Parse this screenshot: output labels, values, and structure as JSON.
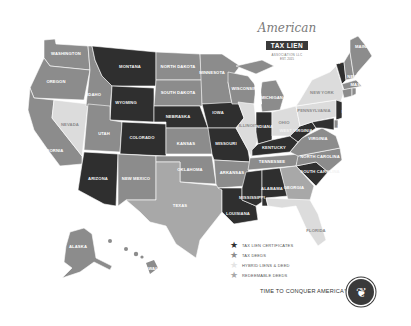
{
  "logo": {
    "script": "American",
    "ribbon": "TAX LIEN",
    "subtitle": "ASSOCIATION LLC",
    "est": "EST. 2015"
  },
  "colors": {
    "tax_lien_certificates": "#2f2f2f",
    "tax_deeds": "#8c8c8c",
    "hybrid_liens_deeds": "#dcdcdc",
    "redeemable_deeds": "#a8a8a8",
    "background": "#ffffff"
  },
  "legend": {
    "items": [
      {
        "label": "TAX LIEN CERTIFICATES",
        "color": "#2f2f2f",
        "icon": "star-icon"
      },
      {
        "label": "TAX DEEDS",
        "color": "#8c8c8c",
        "icon": "star-icon"
      },
      {
        "label": "HYBRID LIENS & DEED",
        "color": "#dcdcdc",
        "icon": "star-icon"
      },
      {
        "label": "REDEEMABLE DEEDS",
        "color": "#a8a8a8",
        "icon": "star-icon"
      }
    ]
  },
  "tagline": "TIME TO CONQUER AMERICA™",
  "seal_icon": "eagle-icon",
  "states": {
    "washington": {
      "label": "WASHINGTON",
      "category": "tax_deeds"
    },
    "oregon": {
      "label": "OREGON",
      "category": "tax_deeds"
    },
    "california": {
      "label": "CALIFORNIA",
      "category": "tax_deeds"
    },
    "nevada": {
      "label": "NEVADA",
      "category": "hybrid_liens_deeds"
    },
    "idaho": {
      "label": "IDAHO",
      "category": "tax_deeds"
    },
    "montana": {
      "label": "MONTANA",
      "category": "tax_lien_certificates"
    },
    "wyoming": {
      "label": "WYOMING",
      "category": "tax_lien_certificates"
    },
    "utah": {
      "label": "UTAH",
      "category": "tax_deeds"
    },
    "colorado": {
      "label": "COLORADO",
      "category": "tax_lien_certificates"
    },
    "arizona": {
      "label": "ARIZONA",
      "category": "tax_lien_certificates"
    },
    "new_mexico": {
      "label": "NEW MEXICO",
      "category": "tax_deeds"
    },
    "north_dakota": {
      "label": "NORTH DAKOTA",
      "category": "tax_deeds"
    },
    "south_dakota": {
      "label": "SOUTH DAKOTA",
      "category": "tax_deeds"
    },
    "nebraska": {
      "label": "NEBRASKA",
      "category": "tax_lien_certificates"
    },
    "kansas": {
      "label": "KANSAS",
      "category": "tax_deeds"
    },
    "oklahoma": {
      "label": "OKLAHOMA",
      "category": "tax_deeds"
    },
    "texas": {
      "label": "TEXAS",
      "category": "redeemable_deeds"
    },
    "minnesota": {
      "label": "MINNESOTA",
      "category": "tax_deeds"
    },
    "iowa": {
      "label": "IOWA",
      "category": "tax_lien_certificates"
    },
    "missouri": {
      "label": "MISSOURI",
      "category": "tax_lien_certificates"
    },
    "arkansas": {
      "label": "ARKANSAS",
      "category": "tax_deeds"
    },
    "louisiana": {
      "label": "LOUISIANA",
      "category": "tax_lien_certificates"
    },
    "wisconsin": {
      "label": "WISCONSIN",
      "category": "tax_deeds"
    },
    "illinois": {
      "label": "ILLINOIS",
      "category": "hybrid_liens_deeds"
    },
    "michigan": {
      "label": "MICHIGAN",
      "category": "tax_deeds"
    },
    "indiana": {
      "label": "INDIANA",
      "category": "tax_lien_certificates"
    },
    "ohio": {
      "label": "OHIO",
      "category": "hybrid_liens_deeds"
    },
    "kentucky": {
      "label": "KENTUCKY",
      "category": "tax_lien_certificates"
    },
    "tennessee": {
      "label": "TENNESSEE",
      "category": "tax_deeds"
    },
    "mississippi": {
      "label": "MISSISSIPPI",
      "category": "tax_lien_certificates"
    },
    "alabama": {
      "label": "ALABAMA",
      "category": "tax_lien_certificates"
    },
    "georgia": {
      "label": "GEORGIA",
      "category": "redeemable_deeds"
    },
    "florida": {
      "label": "FLORIDA",
      "category": "hybrid_liens_deeds"
    },
    "south_carolina": {
      "label": "SOUTH CAROLINA",
      "category": "tax_lien_certificates"
    },
    "north_carolina": {
      "label": "NORTH CAROLINA",
      "category": "tax_deeds"
    },
    "virginia": {
      "label": "VIRGINIA",
      "category": "tax_deeds"
    },
    "west_virginia": {
      "label": "WEST VIRGINIA",
      "category": "tax_lien_certificates"
    },
    "pennsylvania": {
      "label": "PENNSYLVANIA",
      "category": "hybrid_liens_deeds"
    },
    "new_york": {
      "label": "NEW YORK",
      "category": "hybrid_liens_deeds"
    },
    "vermont": {
      "label": "VERMONT",
      "category": "tax_lien_certificates"
    },
    "maine": {
      "label": "MAINE",
      "category": "tax_deeds"
    },
    "new_hampshire": {
      "label": "NEW HAMPSHIRE",
      "category": "tax_deeds"
    },
    "massachusetts": {
      "label": "MASSACHUSETTS",
      "category": "tax_deeds"
    },
    "rhode_island": {
      "label": "RHODE ISLAND",
      "category": "tax_deeds"
    },
    "connecticut": {
      "label": "CONNECTICUT",
      "category": "tax_deeds"
    },
    "new_jersey": {
      "label": "NEW JERSEY",
      "category": "tax_lien_certificates"
    },
    "delaware": {
      "label": "DELAWARE",
      "category": "tax_deeds"
    },
    "maryland": {
      "label": "MARYLAND",
      "category": "tax_lien_certificates"
    },
    "alaska": {
      "label": "ALASKA",
      "category": "tax_deeds"
    },
    "hawaii": {
      "label": "HAWAII",
      "category": "tax_deeds"
    }
  }
}
